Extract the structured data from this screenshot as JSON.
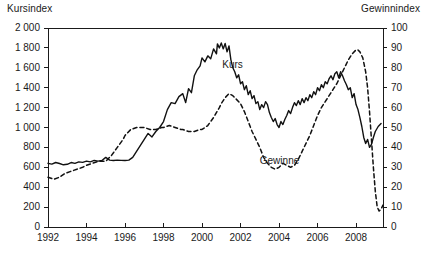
{
  "chart_data": {
    "type": "line",
    "title": "",
    "xlabel": "",
    "ylabel": "Kursindex",
    "y2label": "Gewinnindex",
    "grid": false,
    "legend": "inline-annotations",
    "xlim": [
      1992,
      2009.4
    ],
    "ylim": [
      0,
      2000
    ],
    "y2lim": [
      0,
      100
    ],
    "xticks": [
      1992,
      1994,
      1996,
      1998,
      2000,
      2002,
      2004,
      2006,
      2008
    ],
    "xtick_labels": [
      "1992",
      "1994",
      "1996",
      "1998",
      "2000",
      "2002",
      "2004",
      "2006",
      "2008"
    ],
    "yticks": [
      0,
      200,
      400,
      600,
      800,
      1000,
      1200,
      1400,
      1600,
      1800,
      2000
    ],
    "ytick_labels": [
      "0",
      "200",
      "400",
      "600",
      "800",
      "1 000",
      "1 200",
      "1 400",
      "1 600",
      "1 800",
      "2 000"
    ],
    "y2ticks": [
      0,
      10,
      20,
      30,
      40,
      50,
      60,
      70,
      80,
      90,
      100
    ],
    "y2tick_labels": [
      "0",
      "10",
      "20",
      "30",
      "40",
      "50",
      "60",
      "70",
      "80",
      "90",
      "100"
    ],
    "series": [
      {
        "name": "Kurs",
        "axis": "left",
        "style": "solid",
        "color": "#111111",
        "label_x": 2001.05,
        "label_y": 1630,
        "points": [
          [
            1992.0,
            640
          ],
          [
            1992.2,
            632
          ],
          [
            1992.4,
            648
          ],
          [
            1992.6,
            638
          ],
          [
            1992.8,
            625
          ],
          [
            1993.0,
            630
          ],
          [
            1993.2,
            648
          ],
          [
            1993.4,
            640
          ],
          [
            1993.6,
            655
          ],
          [
            1993.8,
            650
          ],
          [
            1994.0,
            662
          ],
          [
            1994.2,
            655
          ],
          [
            1994.4,
            670
          ],
          [
            1994.6,
            662
          ],
          [
            1994.8,
            668
          ],
          [
            1995.0,
            700
          ],
          [
            1995.2,
            672
          ],
          [
            1995.4,
            668
          ],
          [
            1995.6,
            672
          ],
          [
            1995.8,
            670
          ],
          [
            1996.0,
            668
          ],
          [
            1996.2,
            672
          ],
          [
            1996.4,
            700
          ],
          [
            1996.6,
            760
          ],
          [
            1996.8,
            820
          ],
          [
            1997.0,
            880
          ],
          [
            1997.2,
            940
          ],
          [
            1997.4,
            905
          ],
          [
            1997.6,
            960
          ],
          [
            1997.8,
            1000
          ],
          [
            1998.0,
            1060
          ],
          [
            1998.2,
            1180
          ],
          [
            1998.4,
            1250
          ],
          [
            1998.6,
            1240
          ],
          [
            1998.8,
            1310
          ],
          [
            1999.0,
            1340
          ],
          [
            1999.15,
            1250
          ],
          [
            1999.3,
            1390
          ],
          [
            1999.45,
            1350
          ],
          [
            1999.6,
            1520
          ],
          [
            1999.75,
            1580
          ],
          [
            1999.9,
            1620
          ],
          [
            2000.0,
            1700
          ],
          [
            2000.15,
            1660
          ],
          [
            2000.3,
            1720
          ],
          [
            2000.45,
            1690
          ],
          [
            2000.6,
            1790
          ],
          [
            2000.75,
            1740
          ],
          [
            2000.8,
            1840
          ],
          [
            2000.9,
            1800
          ],
          [
            2001.0,
            1850
          ],
          [
            2001.1,
            1790
          ],
          [
            2001.2,
            1845
          ],
          [
            2001.3,
            1760
          ],
          [
            2001.4,
            1820
          ],
          [
            2001.5,
            1680
          ],
          [
            2001.6,
            1600
          ],
          [
            2001.7,
            1560
          ],
          [
            2001.8,
            1500
          ],
          [
            2001.9,
            1530
          ],
          [
            2002.0,
            1440
          ],
          [
            2002.1,
            1460
          ],
          [
            2002.2,
            1380
          ],
          [
            2002.3,
            1420
          ],
          [
            2002.4,
            1330
          ],
          [
            2002.5,
            1370
          ],
          [
            2002.6,
            1290
          ],
          [
            2002.7,
            1320
          ],
          [
            2002.8,
            1240
          ],
          [
            2002.9,
            1260
          ],
          [
            2003.0,
            1180
          ],
          [
            2003.1,
            1230
          ],
          [
            2003.2,
            1200
          ],
          [
            2003.3,
            1260
          ],
          [
            2003.4,
            1230
          ],
          [
            2003.5,
            1150
          ],
          [
            2003.6,
            1100
          ],
          [
            2003.7,
            1060
          ],
          [
            2003.8,
            1090
          ],
          [
            2003.9,
            1030
          ],
          [
            2004.0,
            1000
          ],
          [
            2004.1,
            1060
          ],
          [
            2004.2,
            1030
          ],
          [
            2004.3,
            1080
          ],
          [
            2004.4,
            1120
          ],
          [
            2004.5,
            1170
          ],
          [
            2004.6,
            1140
          ],
          [
            2004.7,
            1200
          ],
          [
            2004.8,
            1250
          ],
          [
            2004.9,
            1220
          ],
          [
            2005.0,
            1270
          ],
          [
            2005.1,
            1230
          ],
          [
            2005.2,
            1290
          ],
          [
            2005.3,
            1250
          ],
          [
            2005.4,
            1300
          ],
          [
            2005.5,
            1270
          ],
          [
            2005.6,
            1330
          ],
          [
            2005.7,
            1300
          ],
          [
            2005.8,
            1360
          ],
          [
            2005.9,
            1330
          ],
          [
            2006.0,
            1400
          ],
          [
            2006.1,
            1370
          ],
          [
            2006.2,
            1430
          ],
          [
            2006.3,
            1400
          ],
          [
            2006.4,
            1460
          ],
          [
            2006.5,
            1440
          ],
          [
            2006.6,
            1490
          ],
          [
            2006.7,
            1520
          ],
          [
            2006.8,
            1480
          ],
          [
            2006.9,
            1540
          ],
          [
            2007.0,
            1560
          ],
          [
            2007.1,
            1500
          ],
          [
            2007.2,
            1560
          ],
          [
            2007.3,
            1520
          ],
          [
            2007.4,
            1470
          ],
          [
            2007.5,
            1430
          ],
          [
            2007.6,
            1380
          ],
          [
            2007.7,
            1400
          ],
          [
            2007.8,
            1300
          ],
          [
            2007.9,
            1340
          ],
          [
            2008.0,
            1230
          ],
          [
            2008.1,
            1180
          ],
          [
            2008.2,
            1100
          ],
          [
            2008.3,
            1010
          ],
          [
            2008.4,
            900
          ],
          [
            2008.5,
            840
          ],
          [
            2008.6,
            880
          ],
          [
            2008.7,
            800
          ],
          [
            2008.8,
            830
          ],
          [
            2008.9,
            900
          ],
          [
            2009.0,
            960
          ],
          [
            2009.15,
            1010
          ],
          [
            2009.3,
            1040
          ]
        ]
      },
      {
        "name": "Gewinne",
        "axis": "right",
        "style": "dashed",
        "color": "#111111",
        "label_x": 2003.0,
        "label_y": 33,
        "points": [
          [
            1992.0,
            25
          ],
          [
            1992.3,
            24
          ],
          [
            1992.6,
            25
          ],
          [
            1992.9,
            27
          ],
          [
            1993.2,
            28
          ],
          [
            1993.5,
            29
          ],
          [
            1993.8,
            30
          ],
          [
            1994.0,
            31
          ],
          [
            1994.3,
            32
          ],
          [
            1994.6,
            33
          ],
          [
            1994.9,
            33
          ],
          [
            1995.0,
            33
          ],
          [
            1995.3,
            36
          ],
          [
            1995.6,
            40
          ],
          [
            1995.9,
            44
          ],
          [
            1996.0,
            46
          ],
          [
            1996.3,
            49
          ],
          [
            1996.6,
            50
          ],
          [
            1996.9,
            50
          ],
          [
            1997.0,
            50
          ],
          [
            1997.3,
            49
          ],
          [
            1997.6,
            49
          ],
          [
            1997.9,
            50
          ],
          [
            1998.0,
            50
          ],
          [
            1998.3,
            51
          ],
          [
            1998.6,
            50
          ],
          [
            1998.9,
            49
          ],
          [
            1999.0,
            49
          ],
          [
            1999.3,
            48
          ],
          [
            1999.6,
            48
          ],
          [
            1999.9,
            49
          ],
          [
            2000.0,
            49
          ],
          [
            2000.3,
            51
          ],
          [
            2000.6,
            55
          ],
          [
            2000.9,
            60
          ],
          [
            2001.0,
            62
          ],
          [
            2001.2,
            65
          ],
          [
            2001.4,
            67
          ],
          [
            2001.6,
            66
          ],
          [
            2001.8,
            64
          ],
          [
            2002.0,
            62
          ],
          [
            2002.2,
            58
          ],
          [
            2002.4,
            53
          ],
          [
            2002.6,
            48
          ],
          [
            2002.8,
            44
          ],
          [
            2003.0,
            40
          ],
          [
            2003.2,
            35
          ],
          [
            2003.4,
            32
          ],
          [
            2003.6,
            30
          ],
          [
            2003.8,
            29
          ],
          [
            2004.0,
            30
          ],
          [
            2004.2,
            32
          ],
          [
            2004.4,
            31
          ],
          [
            2004.6,
            30
          ],
          [
            2004.8,
            31
          ],
          [
            2005.0,
            34
          ],
          [
            2005.2,
            38
          ],
          [
            2005.4,
            42
          ],
          [
            2005.6,
            46
          ],
          [
            2005.8,
            51
          ],
          [
            2006.0,
            56
          ],
          [
            2006.2,
            60
          ],
          [
            2006.4,
            63
          ],
          [
            2006.6,
            66
          ],
          [
            2006.8,
            69
          ],
          [
            2007.0,
            72
          ],
          [
            2007.2,
            76
          ],
          [
            2007.4,
            80
          ],
          [
            2007.6,
            84
          ],
          [
            2007.8,
            87
          ],
          [
            2008.0,
            89
          ],
          [
            2008.1,
            89
          ],
          [
            2008.2,
            88
          ],
          [
            2008.35,
            85
          ],
          [
            2008.5,
            78
          ],
          [
            2008.6,
            70
          ],
          [
            2008.7,
            58
          ],
          [
            2008.8,
            44
          ],
          [
            2008.9,
            30
          ],
          [
            2009.0,
            18
          ],
          [
            2009.1,
            10
          ],
          [
            2009.2,
            8
          ],
          [
            2009.3,
            9
          ],
          [
            2009.4,
            11
          ]
        ]
      }
    ]
  }
}
